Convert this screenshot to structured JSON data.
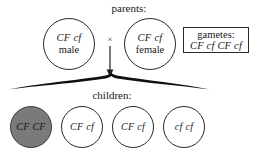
{
  "diagram": {
    "parents_label": "parents:",
    "children_label": "children:",
    "cross_symbol": "×",
    "parents": [
      {
        "genotype": "CF cf",
        "sex": "male"
      },
      {
        "genotype": "CF cf",
        "sex": "female"
      }
    ],
    "gametes": {
      "title": "gametes:",
      "value": "CF cf CF cf"
    },
    "children": [
      {
        "genotype": "CF CF",
        "affected": true
      },
      {
        "genotype": "CF cf",
        "affected": false
      },
      {
        "genotype": "CF cf",
        "affected": false
      },
      {
        "genotype": "cf  cf",
        "affected": false
      }
    ],
    "colors": {
      "stroke": "#2a2a2a",
      "affected_fill": "#7a7a7a",
      "unaffected_fill": "#ffffff",
      "background": "#ffffff",
      "text": "#171717"
    }
  }
}
